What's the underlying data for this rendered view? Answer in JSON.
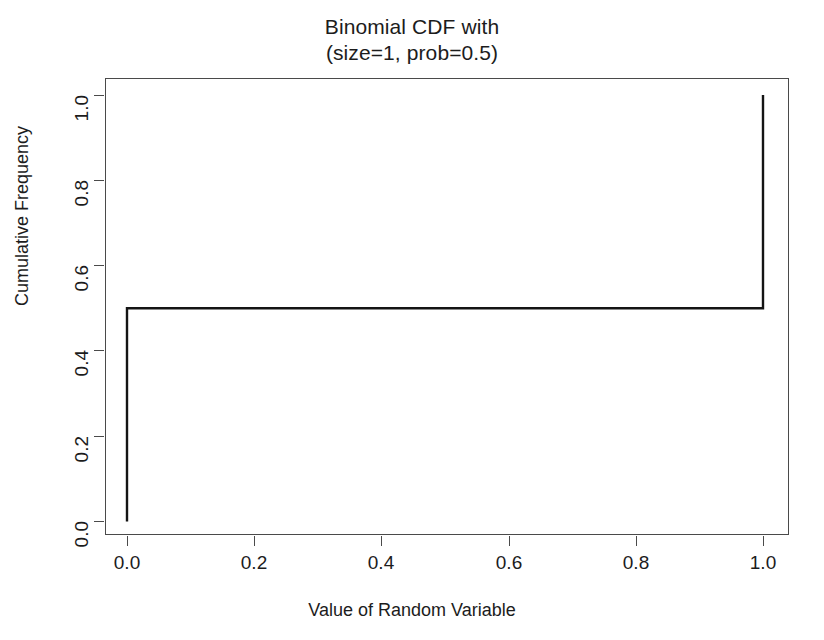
{
  "chart_data": {
    "type": "line",
    "subtype": "step",
    "title": "Binomial CDF with\n(size=1, prob=0.5)",
    "title_lines": [
      "Binomial CDF with",
      "(size=1, prob=0.5)"
    ],
    "xlabel": "Value of Random Variable",
    "ylabel": "Cumulative Frequency",
    "xlim": [
      -0.04,
      1.04
    ],
    "ylim": [
      -0.03,
      1.03
    ],
    "xticks": [
      0.0,
      0.2,
      0.4,
      0.6,
      0.8,
      1.0
    ],
    "xtick_labels": [
      "0.0",
      "0.2",
      "0.4",
      "0.6",
      "0.8",
      "1.0"
    ],
    "yticks": [
      0.0,
      0.2,
      0.4,
      0.6,
      0.8,
      1.0
    ],
    "ytick_labels": [
      "0.0",
      "0.2",
      "0.4",
      "0.6",
      "0.8",
      "1.0"
    ],
    "grid": false,
    "legend": null,
    "series": [
      {
        "name": "Binomial CDF (size=1, prob=0.5)",
        "color": "#141414",
        "line_width": 2.4,
        "points": [
          {
            "x": 0.0,
            "y": 0.0
          },
          {
            "x": 0.0,
            "y": 0.5
          },
          {
            "x": 1.0,
            "y": 0.5
          },
          {
            "x": 1.0,
            "y": 1.0
          }
        ]
      }
    ],
    "steps": [
      {
        "x": 0.0,
        "cdf": 0.5
      },
      {
        "x": 1.0,
        "cdf": 1.0
      }
    ],
    "axis_color": "#4a4a4a",
    "background": "#ffffff"
  }
}
